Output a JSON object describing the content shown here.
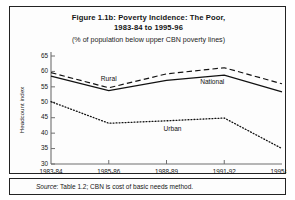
{
  "figure": {
    "title_line1": "Figure 1.1b: Poverty Incidence: The Poor,",
    "title_line2": "1983-84 to 1995-96",
    "subtitle": "(% of population below upper CBN poverty lines)",
    "source_prefix": "Source",
    "source_text": ": Table 1.2; CBN is cost of basic needs method."
  },
  "chart_data": {
    "type": "line",
    "title": "Figure 1.1b: Poverty Incidence: The Poor, 1983-84 to 1995-96",
    "subtitle": "(% of population below upper CBN poverty lines)",
    "xlabel": "",
    "ylabel": "Headcount index",
    "categories": [
      "1983-84",
      "1985-86",
      "1988-89",
      "1991-92",
      "1995-96"
    ],
    "ylim": [
      30,
      65
    ],
    "yticks": [
      30,
      35,
      40,
      45,
      50,
      55,
      60,
      65
    ],
    "ytick_labels": [
      "30",
      "35",
      "40",
      "45",
      "50",
      "55",
      "60",
      "65"
    ],
    "grid": false,
    "legend": "inline-annotations",
    "series": [
      {
        "name": "Rural",
        "style": "dashed",
        "values": [
          59.6,
          54.7,
          59.2,
          61.2,
          56.0
        ]
      },
      {
        "name": "National",
        "style": "solid",
        "values": [
          58.5,
          53.8,
          57.1,
          58.8,
          53.4
        ]
      },
      {
        "name": "Urban",
        "style": "dotted",
        "values": [
          50.2,
          43.2,
          44.0,
          44.9,
          35.0
        ]
      }
    ],
    "annotations": [
      {
        "text": "Rural",
        "series": "Rural",
        "at": "1985-86"
      },
      {
        "text": "National",
        "series": "National",
        "at": "1991-92"
      },
      {
        "text": "Urban",
        "series": "Urban",
        "at": "1988-89"
      }
    ]
  }
}
